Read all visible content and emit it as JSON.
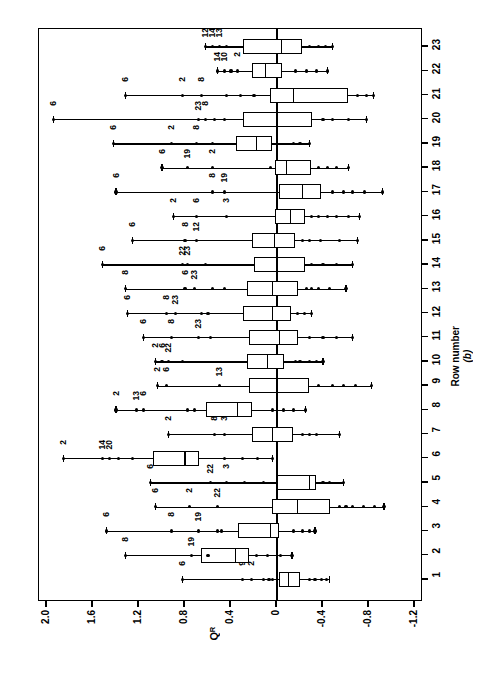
{
  "chart_data": {
    "type": "boxplot",
    "title": "",
    "orientation": "horizontal-value-axis",
    "xlabel": "Row number",
    "panel_label": "(b)",
    "ylabel": "Q_R",
    "ylabel_glyph": "Qᴿ",
    "value_axis_ticks": [
      "2.0",
      "1.6",
      "1.2",
      "0.8",
      "0.4",
      "0",
      "-0.4",
      "-0.8",
      "-1.2"
    ],
    "value_axis_values": [
      2.0,
      1.6,
      1.2,
      0.8,
      0.4,
      0,
      -0.4,
      -0.8,
      -1.2
    ],
    "ylim": [
      2.0,
      -1.2
    ],
    "categories": [
      "1",
      "2",
      "3",
      "4",
      "5",
      "6",
      "7",
      "8",
      "9",
      "10",
      "11",
      "12",
      "13",
      "14",
      "15",
      "16",
      "17",
      "18",
      "19",
      "20",
      "21",
      "22",
      "23"
    ],
    "grid": false,
    "legend": "none",
    "zero_reference_line": 0,
    "boxes": [
      {
        "row": "1",
        "low_whisker": 0.82,
        "q1": -0.02,
        "median": -0.1,
        "q3": -0.2,
        "high_whisker": -0.46,
        "outliers": [
          0.82,
          0.3,
          0.22,
          0.12,
          0.07,
          0.04,
          -0.28,
          -0.33,
          -0.39,
          -0.43
        ],
        "labels": [
          {
            "text": "6",
            "value": 0.82
          },
          {
            "text": "9",
            "value": 0.3
          },
          {
            "text": "2",
            "value": 0.22
          }
        ]
      },
      {
        "row": "2",
        "low_whisker": 1.32,
        "q1": 0.66,
        "median": 0.36,
        "q3": 0.24,
        "high_whisker": -0.13,
        "outliers": [
          1.32,
          0.74,
          0.6,
          0.18,
          0.08,
          -0.03,
          -0.13
        ],
        "labels": [
          {
            "text": "8",
            "value": 1.32
          },
          {
            "text": "19",
            "value": 0.74
          }
        ]
      },
      {
        "row": "3",
        "low_whisker": 1.48,
        "q1": 0.34,
        "median": 0.06,
        "q3": -0.02,
        "high_whisker": -0.33,
        "outliers": [
          1.48,
          0.92,
          0.68,
          0.52,
          0.48,
          -0.14,
          -0.22,
          -0.28,
          -0.33
        ],
        "labels": [
          {
            "text": "6",
            "value": 1.48
          },
          {
            "text": "8",
            "value": 0.92
          },
          {
            "text": "19",
            "value": 0.68
          }
        ]
      },
      {
        "row": "4",
        "low_whisker": 1.06,
        "q1": 0.04,
        "median": -0.18,
        "q3": -0.46,
        "high_whisker": -0.93,
        "outliers": [
          1.06,
          0.76,
          0.52,
          -0.54,
          -0.6,
          -0.66,
          -0.75,
          -0.85,
          -0.93
        ],
        "labels": [
          {
            "text": "6",
            "value": 1.06
          },
          {
            "text": "2",
            "value": 0.76
          },
          {
            "text": "22",
            "value": 0.52
          }
        ]
      },
      {
        "row": "5",
        "low_whisker": 1.1,
        "q1": 0.0,
        "median": -0.28,
        "q3": -0.34,
        "high_whisker": -0.58,
        "outliers": [
          1.1,
          0.58,
          0.44,
          0.28,
          0.12,
          -0.4,
          -0.46,
          -0.58
        ],
        "labels": [
          {
            "text": "6",
            "value": 1.1
          },
          {
            "text": "22",
            "value": 0.58
          },
          {
            "text": "3",
            "value": 0.44
          }
        ]
      },
      {
        "row": "6",
        "low_whisker": 1.86,
        "q1": 1.08,
        "median": 0.8,
        "q3": 0.68,
        "high_whisker": 0.04,
        "outliers": [
          1.86,
          1.52,
          1.46,
          1.38,
          1.26,
          0.46,
          0.3,
          0.17,
          0.04
        ],
        "labels": [
          {
            "text": "2",
            "value": 1.86
          },
          {
            "text": "14",
            "value": 1.52
          },
          {
            "text": "20",
            "value": 1.46
          }
        ]
      },
      {
        "row": "7",
        "low_whisker": 0.94,
        "q1": 0.22,
        "median": 0.04,
        "q3": -0.14,
        "high_whisker": -0.54,
        "outliers": [
          0.94,
          0.54,
          0.46,
          -0.22,
          -0.28,
          -0.34,
          -0.54
        ],
        "labels": [
          {
            "text": "2",
            "value": 0.94
          },
          {
            "text": "8",
            "value": 0.54
          },
          {
            "text": "3",
            "value": 0.46
          }
        ]
      },
      {
        "row": "8",
        "low_whisker": 1.4,
        "q1": 0.62,
        "median": 0.34,
        "q3": 0.22,
        "high_whisker": -0.25,
        "outliers": [
          1.4,
          1.22,
          1.16,
          0.78,
          0.72,
          0.04,
          -0.06,
          -0.14,
          -0.25
        ],
        "labels": [
          {
            "text": "2",
            "value": 1.4
          },
          {
            "text": "13",
            "value": 1.22
          },
          {
            "text": "6",
            "value": 1.16
          }
        ]
      },
      {
        "row": "9",
        "low_whisker": 1.04,
        "q1": 0.24,
        "median": 0.0,
        "q3": -0.28,
        "high_whisker": -0.82,
        "outliers": [
          1.04,
          0.96,
          0.5,
          -0.36,
          -0.48,
          -0.58,
          -0.68,
          -0.82
        ],
        "labels": [
          {
            "text": "2",
            "value": 1.04
          },
          {
            "text": "6",
            "value": 0.96
          },
          {
            "text": "13",
            "value": 0.5
          }
        ]
      },
      {
        "row": "10",
        "low_whisker": 1.06,
        "q1": 0.26,
        "median": 0.08,
        "q3": -0.06,
        "high_whisker": -0.4,
        "outliers": [
          1.06,
          1.0,
          0.94,
          0.82,
          -0.16,
          -0.2,
          -0.28,
          -0.34,
          -0.4
        ],
        "labels": [
          {
            "text": "2",
            "value": 1.06
          },
          {
            "text": "6",
            "value": 1.0
          },
          {
            "text": "22",
            "value": 0.94
          }
        ]
      },
      {
        "row": "11",
        "low_whisker": 1.16,
        "q1": 0.24,
        "median": -0.02,
        "q3": -0.18,
        "high_whisker": -0.66,
        "outliers": [
          1.16,
          0.92,
          0.68,
          0.58,
          -0.28,
          -0.4,
          -0.52,
          -0.66
        ],
        "labels": [
          {
            "text": "6",
            "value": 1.16
          },
          {
            "text": "8",
            "value": 0.92
          },
          {
            "text": "23",
            "value": 0.68
          }
        ]
      },
      {
        "row": "12",
        "low_whisker": 1.3,
        "q1": 0.3,
        "median": 0.04,
        "q3": -0.12,
        "high_whisker": -0.3,
        "outliers": [
          1.3,
          0.96,
          0.88,
          0.66,
          0.6,
          -0.18,
          -0.24,
          -0.3
        ],
        "labels": [
          {
            "text": "6",
            "value": 1.3
          },
          {
            "text": "8",
            "value": 0.96
          },
          {
            "text": "23",
            "value": 0.88
          }
        ]
      },
      {
        "row": "13",
        "low_whisker": 1.32,
        "q1": 0.26,
        "median": 0.04,
        "q3": -0.18,
        "high_whisker": -0.6,
        "outliers": [
          1.32,
          0.8,
          0.72,
          0.56,
          0.46,
          -0.26,
          -0.3,
          -0.36,
          -0.46,
          -0.6
        ],
        "labels": [
          {
            "text": "8",
            "value": 1.32
          },
          {
            "text": "6",
            "value": 0.8
          },
          {
            "text": "23",
            "value": 0.72
          }
        ]
      },
      {
        "row": "14",
        "low_whisker": 1.52,
        "q1": 0.2,
        "median": 0.0,
        "q3": -0.24,
        "high_whisker": -0.66,
        "outliers": [
          1.52,
          0.82,
          0.78,
          0.62,
          -0.3,
          -0.4,
          -0.52,
          -0.66
        ],
        "labels": [
          {
            "text": "6",
            "value": 1.52
          },
          {
            "text": "22",
            "value": 0.82
          },
          {
            "text": "23",
            "value": 0.78
          }
        ]
      },
      {
        "row": "15",
        "low_whisker": 1.26,
        "q1": 0.22,
        "median": 0.02,
        "q3": -0.16,
        "high_whisker": -0.7,
        "outliers": [
          1.26,
          0.8,
          0.7,
          -0.22,
          -0.28,
          -0.38,
          -0.54,
          -0.7
        ],
        "labels": [
          {
            "text": "6",
            "value": 1.26
          },
          {
            "text": "8",
            "value": 0.8
          },
          {
            "text": "12",
            "value": 0.7
          }
        ]
      },
      {
        "row": "16",
        "low_whisker": 0.9,
        "q1": 0.02,
        "median": -0.12,
        "q3": -0.24,
        "high_whisker": -0.72,
        "outliers": [
          0.9,
          0.7,
          0.44,
          -0.3,
          -0.36,
          -0.44,
          -0.52,
          -0.62,
          -0.72
        ],
        "labels": [
          {
            "text": "2",
            "value": 0.9
          },
          {
            "text": "6",
            "value": 0.7
          },
          {
            "text": "3",
            "value": 0.44
          }
        ]
      },
      {
        "row": "17",
        "low_whisker": 1.4,
        "q1": -0.02,
        "median": -0.22,
        "q3": -0.38,
        "high_whisker": -0.92,
        "outliers": [
          1.4,
          0.56,
          0.46,
          -0.48,
          -0.58,
          -0.66,
          -0.76,
          -0.92
        ],
        "labels": [
          {
            "text": "6",
            "value": 1.4
          },
          {
            "text": "8",
            "value": 0.56
          },
          {
            "text": "19",
            "value": 0.46
          }
        ]
      },
      {
        "row": "18",
        "low_whisker": 1.0,
        "q1": 0.02,
        "median": -0.08,
        "q3": -0.3,
        "high_whisker": -0.62,
        "outliers": [
          1.0,
          0.78,
          0.56,
          0.06,
          -0.36,
          -0.44,
          -0.52,
          -0.62
        ],
        "labels": [
          {
            "text": "6",
            "value": 1.0
          },
          {
            "text": "19",
            "value": 0.78
          },
          {
            "text": "2",
            "value": 0.56
          }
        ]
      },
      {
        "row": "19",
        "low_whisker": 1.42,
        "q1": 0.36,
        "median": 0.18,
        "q3": 0.04,
        "high_whisker": -0.28,
        "outliers": [
          1.42,
          0.92,
          0.7,
          0.56,
          -0.14,
          -0.2,
          -0.28
        ],
        "labels": [
          {
            "text": "6",
            "value": 1.42
          },
          {
            "text": "2",
            "value": 0.92
          },
          {
            "text": "8",
            "value": 0.7
          }
        ]
      },
      {
        "row": "20",
        "low_whisker": 1.94,
        "q1": 0.3,
        "median": 0.0,
        "q3": -0.3,
        "high_whisker": -0.78,
        "outliers": [
          1.94,
          0.68,
          0.62,
          0.54,
          0.46,
          -0.4,
          -0.48,
          -0.62,
          -0.78
        ],
        "labels": [
          {
            "text": "6",
            "value": 1.94
          },
          {
            "text": "23",
            "value": 0.68
          },
          {
            "text": "8",
            "value": 0.62
          }
        ]
      },
      {
        "row": "21",
        "low_whisker": 1.32,
        "q1": 0.06,
        "median": -0.14,
        "q3": -0.62,
        "high_whisker": -0.84,
        "outliers": [
          1.32,
          0.82,
          0.66,
          0.44,
          0.32,
          0.2,
          -0.7,
          -0.78,
          -0.84
        ],
        "labels": [
          {
            "text": "6",
            "value": 1.32
          },
          {
            "text": "2",
            "value": 0.82
          },
          {
            "text": "8",
            "value": 0.66
          }
        ]
      },
      {
        "row": "22",
        "low_whisker": 0.52,
        "q1": 0.22,
        "median": 0.1,
        "q3": -0.04,
        "high_whisker": -0.44,
        "outliers": [
          0.52,
          0.46,
          0.4,
          0.34,
          -0.16,
          -0.26,
          -0.34,
          -0.44
        ],
        "labels": [
          {
            "text": "14",
            "value": 0.52
          },
          {
            "text": "10",
            "value": 0.46
          },
          {
            "text": "2",
            "value": 0.34
          }
        ]
      },
      {
        "row": "23",
        "low_whisker": 0.62,
        "q1": 0.3,
        "median": -0.04,
        "q3": -0.22,
        "high_whisker": -0.48,
        "outliers": [
          0.62,
          0.56,
          0.5,
          0.44,
          -0.28,
          -0.36,
          -0.42,
          -0.48
        ],
        "labels": [
          {
            "text": "12",
            "value": 0.62
          },
          {
            "text": "14",
            "value": 0.56
          },
          {
            "text": "13",
            "value": 0.5
          }
        ]
      }
    ]
  }
}
